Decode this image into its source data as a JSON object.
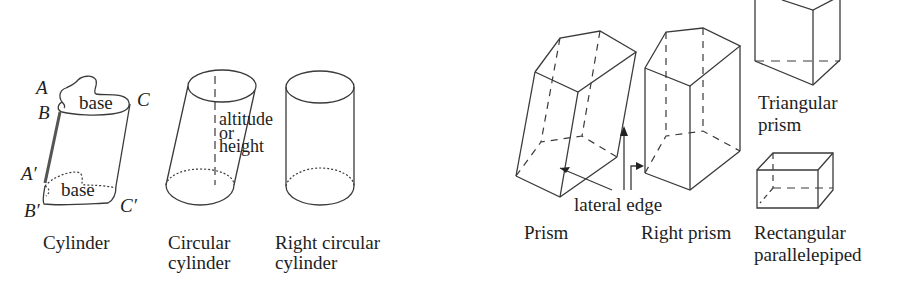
{
  "figures": {
    "cylinder": {
      "caption": "Cylinder",
      "points": {
        "A": "A",
        "B": "B",
        "C": "C",
        "A_prime": "A′",
        "B_prime": "B′",
        "C_prime": "C′"
      },
      "top_base": "base",
      "bottom_base": "base"
    },
    "circular_cylinder": {
      "caption_line1": "Circular",
      "caption_line2": "cylinder",
      "altitude_line1": "altitude",
      "altitude_line2": "or",
      "altitude_line3": "height"
    },
    "right_circular_cylinder": {
      "caption_line1": "Right circular",
      "caption_line2": "cylinder"
    },
    "prism": {
      "caption": "Prism",
      "lateral_edge": "lateral edge"
    },
    "right_prism": {
      "caption": "Right prism"
    },
    "triangular_prism": {
      "caption_line1": "Triangular",
      "caption_line2": "prism"
    },
    "rectangular_parallelepiped": {
      "caption_line1": "Rectangular",
      "caption_line2": "parallelepiped"
    }
  }
}
